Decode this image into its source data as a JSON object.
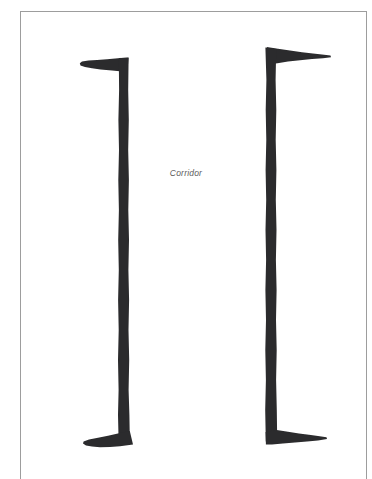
{
  "page": {
    "width": 372,
    "height": 479,
    "background_color": "#ffffff",
    "frame_color": "#9d9d9d"
  },
  "diagram": {
    "title_label": "Corridor",
    "ink_color": "#2b2b2d",
    "elements": [
      {
        "name": "left-wall-bracket",
        "glyph": "]",
        "orientation": "arms-point-left",
        "top_arm": {
          "x_start": 80,
          "x_end": 128,
          "y": 63
        },
        "vertical": {
          "x": 122,
          "y_start": 60,
          "y_end": 440
        },
        "bottom_arm": {
          "x_start": 83,
          "x_end": 133,
          "y": 438
        }
      },
      {
        "name": "right-wall-bracket",
        "glyph": "[",
        "orientation": "arms-point-right",
        "top_arm": {
          "x_start": 268,
          "x_end": 331,
          "y": 52
        },
        "vertical": {
          "x": 270,
          "y_start": 52,
          "y_end": 441
        },
        "bottom_arm": {
          "x_start": 266,
          "x_end": 327,
          "y": 437
        }
      }
    ]
  },
  "caption": {
    "text": "Corridor",
    "color": "#5b5b5b",
    "style": "italic"
  }
}
